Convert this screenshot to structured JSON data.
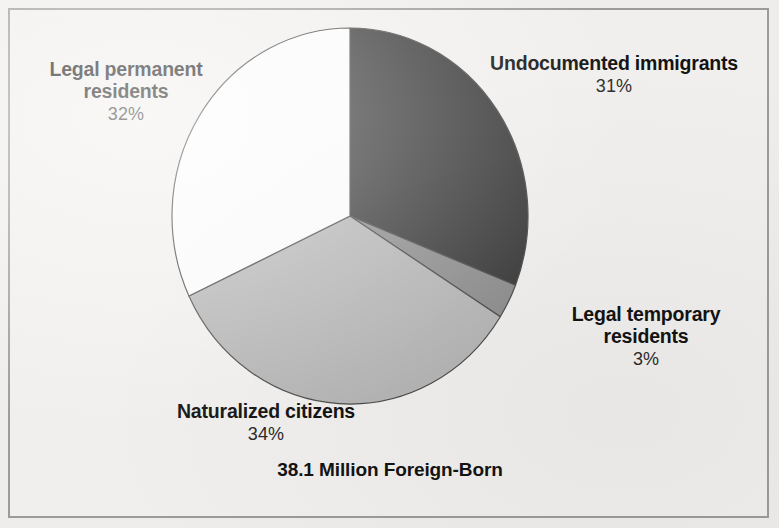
{
  "figure": {
    "caption": "38.1 Million Foreign-Born",
    "background_color": "#eeedeb",
    "border_color": "#9b9b9b",
    "text_color": "#131313"
  },
  "chart_data": {
    "type": "pie",
    "title": "38.1 Million Foreign-Born",
    "subtitle": "",
    "xlabel": "",
    "ylabel": "",
    "total_label": "38.1 Million Foreign-Born",
    "units": "percent of foreign-born population",
    "start_angle_deg": 0,
    "direction": "clockwise",
    "legend": "none (direct slice labels)",
    "grid": false,
    "categories": [
      "Undocumented immigrants",
      "Legal temporary residents",
      "Naturalized citizens",
      "Legal permanent residents"
    ],
    "values": [
      31,
      3,
      34,
      32
    ],
    "value_labels": [
      "31%",
      "3%",
      "34%",
      "32%"
    ],
    "colors": [
      "#3a3a3a",
      "#8d8d8d",
      "#b5b5b5",
      "#fbfbfb"
    ],
    "slices": [
      {
        "label": "Undocumented immigrants",
        "value": 31,
        "value_label": "31%",
        "color": "#3a3a3a",
        "start_deg": 0,
        "end_deg": 111.6
      },
      {
        "label": "Legal temporary residents",
        "value": 3,
        "value_label": "3%",
        "color": "#8d8d8d",
        "start_deg": 111.6,
        "end_deg": 122.4
      },
      {
        "label": "Naturalized citizens",
        "value": 34,
        "value_label": "34%",
        "color": "#b5b5b5",
        "start_deg": 122.4,
        "end_deg": 244.8
      },
      {
        "label": "Legal permanent residents",
        "value": 32,
        "value_label": "32%",
        "color": "#fbfbfb",
        "start_deg": 244.8,
        "end_deg": 360
      }
    ]
  },
  "labels": {
    "legal_permanent": {
      "line1": "Legal permanent",
      "line2": "residents",
      "percent": "32%"
    },
    "undocumented": {
      "line1": "Undocumented immigrants",
      "line2": "",
      "percent": "31%"
    },
    "legal_temporary": {
      "line1": "Legal temporary",
      "line2": "residents",
      "percent": "3%"
    },
    "naturalized": {
      "line1": "Naturalized citizens",
      "line2": "",
      "percent": "34%"
    }
  }
}
